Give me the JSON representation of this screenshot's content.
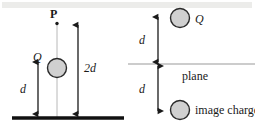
{
  "figure": {
    "caption": "Point charge above a grounded conducting plane and its image charge",
    "colors": {
      "stroke": "#1a1a1a",
      "charge_fill": "#d0d0d0",
      "charge_stroke": "#2a2a2a",
      "guide_line": "#b8b8b8",
      "plane_line": "#9a9a9a",
      "ground_line": "#111111",
      "background": "#ffffff"
    },
    "left_panel": {
      "name": "charge-above-ground-plane",
      "labels": {
        "point_p": "P",
        "charge_q": "Q",
        "distance_d": "d",
        "distance_2d": "2d"
      },
      "elements": {
        "ground_plane": "ground-plane-line",
        "guide_line": "vertical-guide-line",
        "point_marker": "field-point-marker",
        "charge": "charge-sphere",
        "arrow_d": "dimension-arrow-d",
        "arrow_2d": "dimension-arrow-2d"
      }
    },
    "right_panel": {
      "name": "image-charge-construction",
      "labels": {
        "charge_q": "Q",
        "distance_d_above": "d",
        "distance_d_below": "d",
        "plane": "plane",
        "image_charge": "image charge"
      },
      "elements": {
        "plane_line": "plane-line",
        "charge_above": "charge-sphere-above",
        "charge_below": "image-charge-sphere",
        "arrow_above": "dimension-arrow-d-above",
        "arrow_below": "dimension-arrow-d-below"
      }
    }
  }
}
